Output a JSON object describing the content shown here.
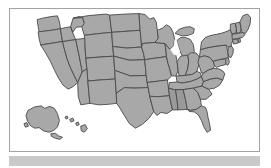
{
  "figure": {
    "type": "map",
    "frame": {
      "border_color": "#a3a3a3",
      "background_color": "#ffffff"
    },
    "bottom_bar": {
      "color": "#c9c9c9",
      "label": ""
    }
  },
  "map": {
    "region": "United States of America",
    "projection": "albers-usa",
    "style": {
      "state_fill": "#a8a8a8",
      "state_fill_dark": "#9a9a9a",
      "state_fill_light": "#b4b4b4",
      "state_border": "#4a4a4a",
      "water_fill": "#ffffff"
    },
    "includes_insets": true,
    "inset_names": [
      "Alaska",
      "Hawaii"
    ],
    "state_count": 50,
    "states": [
      {
        "code": "WA",
        "name": "Washington",
        "shade": "base"
      },
      {
        "code": "OR",
        "name": "Oregon",
        "shade": "base"
      },
      {
        "code": "CA",
        "name": "California",
        "shade": "base"
      },
      {
        "code": "NV",
        "name": "Nevada",
        "shade": "base"
      },
      {
        "code": "ID",
        "name": "Idaho",
        "shade": "base"
      },
      {
        "code": "MT",
        "name": "Montana",
        "shade": "base"
      },
      {
        "code": "WY",
        "name": "Wyoming",
        "shade": "base"
      },
      {
        "code": "UT",
        "name": "Utah",
        "shade": "base"
      },
      {
        "code": "AZ",
        "name": "Arizona",
        "shade": "base"
      },
      {
        "code": "CO",
        "name": "Colorado",
        "shade": "base"
      },
      {
        "code": "NM",
        "name": "New Mexico",
        "shade": "base"
      },
      {
        "code": "ND",
        "name": "North Dakota",
        "shade": "base"
      },
      {
        "code": "SD",
        "name": "South Dakota",
        "shade": "base"
      },
      {
        "code": "NE",
        "name": "Nebraska",
        "shade": "base"
      },
      {
        "code": "KS",
        "name": "Kansas",
        "shade": "base"
      },
      {
        "code": "OK",
        "name": "Oklahoma",
        "shade": "base"
      },
      {
        "code": "TX",
        "name": "Texas",
        "shade": "base"
      },
      {
        "code": "MN",
        "name": "Minnesota",
        "shade": "base"
      },
      {
        "code": "IA",
        "name": "Iowa",
        "shade": "base"
      },
      {
        "code": "MO",
        "name": "Missouri",
        "shade": "base"
      },
      {
        "code": "AR",
        "name": "Arkansas",
        "shade": "base"
      },
      {
        "code": "LA",
        "name": "Louisiana",
        "shade": "base"
      },
      {
        "code": "WI",
        "name": "Wisconsin",
        "shade": "base"
      },
      {
        "code": "IL",
        "name": "Illinois",
        "shade": "base"
      },
      {
        "code": "MI",
        "name": "Michigan",
        "shade": "base"
      },
      {
        "code": "IN",
        "name": "Indiana",
        "shade": "base"
      },
      {
        "code": "OH",
        "name": "Ohio",
        "shade": "base"
      },
      {
        "code": "KY",
        "name": "Kentucky",
        "shade": "base"
      },
      {
        "code": "TN",
        "name": "Tennessee",
        "shade": "base"
      },
      {
        "code": "MS",
        "name": "Mississippi",
        "shade": "dark"
      },
      {
        "code": "AL",
        "name": "Alabama",
        "shade": "dark"
      },
      {
        "code": "GA",
        "name": "Georgia",
        "shade": "base"
      },
      {
        "code": "FL",
        "name": "Florida",
        "shade": "base"
      },
      {
        "code": "SC",
        "name": "South Carolina",
        "shade": "base"
      },
      {
        "code": "NC",
        "name": "North Carolina",
        "shade": "base"
      },
      {
        "code": "VA",
        "name": "Virginia",
        "shade": "base"
      },
      {
        "code": "WV",
        "name": "West Virginia",
        "shade": "base"
      },
      {
        "code": "MD",
        "name": "Maryland",
        "shade": "base"
      },
      {
        "code": "DE",
        "name": "Delaware",
        "shade": "base"
      },
      {
        "code": "PA",
        "name": "Pennsylvania",
        "shade": "base"
      },
      {
        "code": "NJ",
        "name": "New Jersey",
        "shade": "base"
      },
      {
        "code": "NY",
        "name": "New York",
        "shade": "base"
      },
      {
        "code": "CT",
        "name": "Connecticut",
        "shade": "base"
      },
      {
        "code": "RI",
        "name": "Rhode Island",
        "shade": "base"
      },
      {
        "code": "MA",
        "name": "Massachusetts",
        "shade": "base"
      },
      {
        "code": "VT",
        "name": "Vermont",
        "shade": "base"
      },
      {
        "code": "NH",
        "name": "New Hampshire",
        "shade": "base"
      },
      {
        "code": "ME",
        "name": "Maine",
        "shade": "base"
      },
      {
        "code": "AK",
        "name": "Alaska",
        "shade": "base"
      },
      {
        "code": "HI",
        "name": "Hawaii",
        "shade": "base"
      }
    ],
    "water_features": [
      "Lake Michigan",
      "Lake Superior",
      "Lake Huron",
      "Lake Erie",
      "Chesapeake Bay"
    ]
  }
}
